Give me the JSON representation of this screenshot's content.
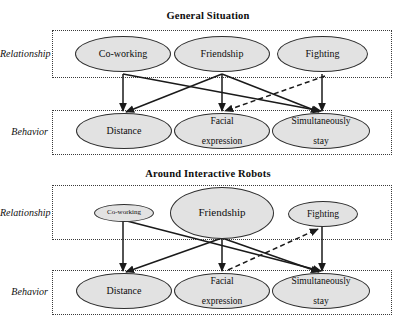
{
  "figure": {
    "kind": "two-panel-node-link-diagram",
    "fill_color": "#e2e2e2",
    "stroke_color": "#2e2e2e",
    "edge_color": "#1a1a1a"
  },
  "panels": [
    {
      "id": "general",
      "title": "General Situation",
      "rows": [
        {
          "label": "Relationship",
          "nodes": [
            {
              "label": "Co-working",
              "size": "large"
            },
            {
              "label": "Friendship",
              "size": "large"
            },
            {
              "label": "Fighting",
              "size": "large"
            }
          ]
        },
        {
          "label": "Behavior",
          "nodes": [
            {
              "label": "Distance",
              "size": "large"
            },
            {
              "label": "Facial\nexpression",
              "line1": "Facial",
              "line2": "expression",
              "size": "large"
            },
            {
              "label": "Simultaneously\nstay",
              "line1": "Simultaneously",
              "line2": "stay",
              "size": "large"
            }
          ]
        }
      ],
      "edges": [
        {
          "from": "Co-working",
          "to": "Distance",
          "style": "solid"
        },
        {
          "from": "Co-working",
          "to": "Simultaneously stay",
          "style": "solid"
        },
        {
          "from": "Friendship",
          "to": "Distance",
          "style": "solid"
        },
        {
          "from": "Friendship",
          "to": "Facial expression",
          "style": "solid"
        },
        {
          "from": "Friendship",
          "to": "Simultaneously stay",
          "style": "solid"
        },
        {
          "from": "Fighting",
          "to": "Simultaneously stay",
          "style": "solid"
        },
        {
          "from": "Fighting",
          "to": "Facial expression",
          "style": "dashed"
        }
      ]
    },
    {
      "id": "robots",
      "title": "Around Interactive Robots",
      "rows": [
        {
          "label": "Relationship",
          "nodes": [
            {
              "label": "Co-working",
              "size": "small"
            },
            {
              "label": "Friendship",
              "size": "xlarge"
            },
            {
              "label": "Fighting",
              "size": "medium"
            }
          ]
        },
        {
          "label": "Behavior",
          "nodes": [
            {
              "label": "Distance",
              "size": "large"
            },
            {
              "label": "Facial\nexpression",
              "line1": "Facial",
              "line2": "expression",
              "size": "large"
            },
            {
              "label": "Simultaneously\nstay",
              "line1": "Simultaneously",
              "line2": "stay",
              "size": "large"
            }
          ]
        }
      ],
      "edges": [
        {
          "from": "Co-working",
          "to": "Distance",
          "style": "solid"
        },
        {
          "from": "Co-working",
          "to": "Simultaneously stay",
          "style": "solid"
        },
        {
          "from": "Friendship",
          "to": "Distance",
          "style": "solid"
        },
        {
          "from": "Friendship",
          "to": "Facial expression",
          "style": "solid"
        },
        {
          "from": "Friendship",
          "to": "Simultaneously stay",
          "style": "solid"
        },
        {
          "from": "Fighting",
          "to": "Simultaneously stay",
          "style": "solid"
        },
        {
          "from": "Facial expression",
          "to": "Fighting",
          "style": "dashed"
        }
      ]
    }
  ]
}
